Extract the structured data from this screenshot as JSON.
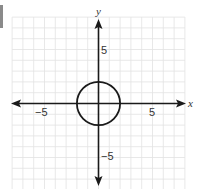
{
  "chart_data": {
    "type": "line",
    "title": "",
    "xlabel": "x",
    "ylabel": "y",
    "xlim": [
      -8,
      8
    ],
    "ylim": [
      -8,
      8
    ],
    "grid": true,
    "grid_step": 1,
    "x_tick_labels": [
      {
        "value": -5,
        "label": "−5"
      },
      {
        "value": 5,
        "label": "5"
      }
    ],
    "y_tick_labels": [
      {
        "value": 5,
        "label": "5"
      },
      {
        "value": -5,
        "label": "−5"
      }
    ],
    "series": [
      {
        "name": "circle",
        "shape": "circle",
        "equation": "x^2 + y^2 = 4",
        "center": [
          0,
          0
        ],
        "radius": 2
      }
    ],
    "legend": null
  },
  "colors": {
    "grid": "#e2e2e2",
    "axis": "#1a1a1a",
    "curve": "#1a1a1a",
    "text": "#333333",
    "side_bar": "#8a8a8a"
  },
  "labels": {
    "x_axis": "x",
    "y_axis": "y",
    "x_neg5": "−5",
    "x_pos5": "5",
    "y_pos5": "5",
    "y_neg5": "−5"
  }
}
